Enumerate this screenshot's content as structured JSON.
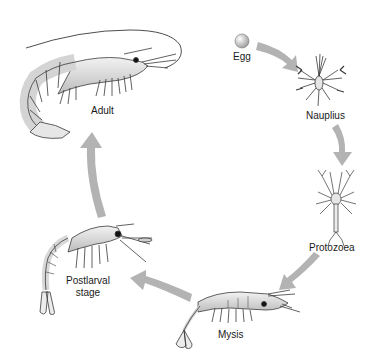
{
  "diagram": {
    "type": "life-cycle",
    "stages": [
      {
        "id": "egg",
        "label": "Egg"
      },
      {
        "id": "nauplius",
        "label": "Nauplius"
      },
      {
        "id": "protozoea",
        "label": "Protozoea"
      },
      {
        "id": "mysis",
        "label": "Mysis"
      },
      {
        "id": "postlarval",
        "label": "Postlarval stage",
        "label_line1": "Postlarval",
        "label_line2": "stage"
      },
      {
        "id": "adult",
        "label": "Adult"
      }
    ],
    "arrows": [
      {
        "from": "egg",
        "to": "nauplius"
      },
      {
        "from": "nauplius",
        "to": "protozoea"
      },
      {
        "from": "protozoea",
        "to": "mysis"
      },
      {
        "from": "mysis",
        "to": "postlarval"
      },
      {
        "from": "postlarval",
        "to": "adult"
      }
    ],
    "colors": {
      "arrow": "#b3b3b3",
      "outline": "#3a3a3a",
      "body_fill": "#e2e2e2",
      "egg": "#c8c8c8"
    }
  }
}
